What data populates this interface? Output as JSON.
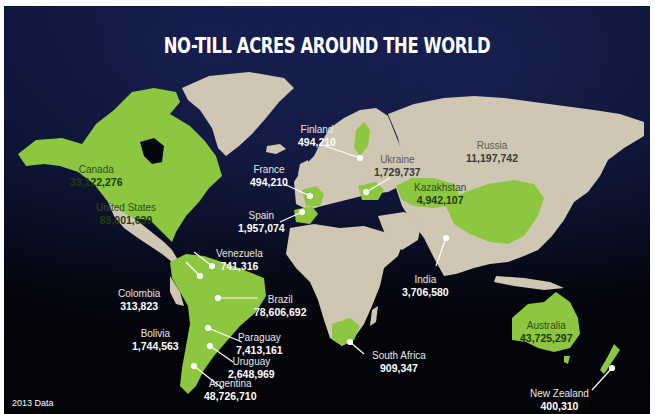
{
  "title": "NO-TILL ACRES AROUND THE WORLD",
  "footnote": "2013 Data",
  "colors": {
    "ocean": "#05060f",
    "land": "#cfc7b4",
    "highlight": "#8dc63f",
    "title_text": "#ffffff",
    "leader_line": "#ffffff"
  },
  "countries": [
    {
      "name": "Canada",
      "value": "33,122,276"
    },
    {
      "name": "United States",
      "value": "88,001,639"
    },
    {
      "name": "Finland",
      "value": "494,210"
    },
    {
      "name": "France",
      "value": "494,210"
    },
    {
      "name": "Spain",
      "value": "1,957,074"
    },
    {
      "name": "Ukraine",
      "value": "1,729,737"
    },
    {
      "name": "Russia",
      "value": "11,197,742"
    },
    {
      "name": "Kazakhstan",
      "value": "4,942,107"
    },
    {
      "name": "India",
      "value": "3,706,580"
    },
    {
      "name": "Venezuela",
      "value": "741,316"
    },
    {
      "name": "Colombia",
      "value": "313,823"
    },
    {
      "name": "Brazil",
      "value": "78,606,692"
    },
    {
      "name": "Bolivia",
      "value": "1,744,563"
    },
    {
      "name": "Paraguay",
      "value": "7,413,161"
    },
    {
      "name": "Uruguay",
      "value": "2,648,969"
    },
    {
      "name": "Argentina",
      "value": "48,726,710"
    },
    {
      "name": "South Africa",
      "value": "909,347"
    },
    {
      "name": "Australia",
      "value": "43,725,297"
    },
    {
      "name": "New Zealand",
      "value": "400,310"
    }
  ],
  "highlighted_unlabeled": [
    "China"
  ]
}
